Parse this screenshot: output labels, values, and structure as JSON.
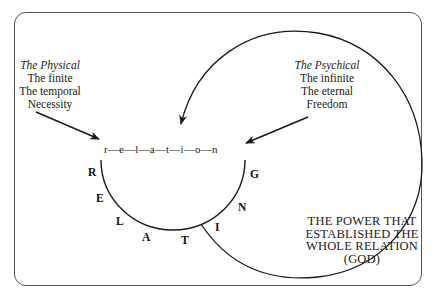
{
  "diagram": {
    "left_block": {
      "heading": "The Physical",
      "lines": [
        "The finite",
        "The temporal",
        "Necessity"
      ]
    },
    "right_block": {
      "heading": "The Psychical",
      "lines": [
        "The infinite",
        "The eternal",
        "Freedom"
      ]
    },
    "relation_word": "r—e—l—a—t—i—o—n",
    "arc_letters": [
      "R",
      "E",
      "L",
      "A",
      "T",
      "I",
      "N",
      "G"
    ],
    "power_label": {
      "lines": [
        "THE POWER THAT",
        "ESTABLISHED THE",
        "WHOLE RELATION",
        "(GOD)"
      ]
    },
    "colors": {
      "stroke": "#1a1a1a",
      "frame": "#555555",
      "background": "#ffffff"
    }
  }
}
